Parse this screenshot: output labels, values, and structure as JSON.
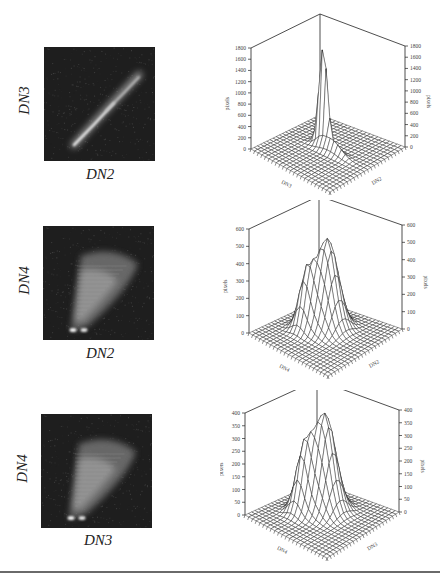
{
  "chart_data": [
    {
      "type": "heatmap",
      "title": "",
      "xlabel": "DN2",
      "ylabel": "DN3",
      "description": "2D scatter-density image: narrow bright diagonal streak from lower-left to upper-right",
      "feature": "diagonal-streak"
    },
    {
      "type": "surface3d",
      "title": "",
      "xlabel": "DN3",
      "ylabel": "DN2",
      "zlabel": "pixels",
      "zticks": [
        0,
        200,
        400,
        600,
        800,
        1000,
        1200,
        1400,
        1600,
        1800
      ],
      "zlim": [
        0,
        1800
      ],
      "peak": 1750,
      "description": "Single very sharp narrow peak near the center-left of the grid"
    },
    {
      "type": "heatmap",
      "title": "",
      "xlabel": "DN2",
      "ylabel": "DN4",
      "description": "2D scatter-density image: broad fan-shaped bright region with two small bright spots at the bottom-left",
      "feature": "fan"
    },
    {
      "type": "surface3d",
      "title": "",
      "xlabel": "DN4",
      "ylabel": "DN2",
      "zlabel": "pixels",
      "zticks": [
        0,
        100,
        200,
        300,
        400,
        500,
        600
      ],
      "zlim": [
        0,
        600
      ],
      "peak": 520,
      "secondary_peak": 110,
      "description": "Broad main ridge peaking ~520 with a small secondary peak ~110"
    },
    {
      "type": "heatmap",
      "title": "",
      "xlabel": "DN3",
      "ylabel": "DN4",
      "description": "2D scatter-density image: broad fan-shaped faint region with small bright spots at bottom-left",
      "feature": "fan"
    },
    {
      "type": "surface3d",
      "title": "",
      "xlabel": "DN4",
      "ylabel": "DN3",
      "zlabel": "pixels",
      "zticks": [
        0,
        50,
        100,
        150,
        200,
        250,
        300,
        350,
        400
      ],
      "zlim": [
        0,
        400
      ],
      "peak": 380,
      "secondary_peak": 100,
      "description": "Broad main ridge peaking ~380 with a small secondary peak ~100"
    }
  ],
  "rows": [
    {
      "image": {
        "xlabel": "DN2",
        "ylabel": "DN3"
      },
      "surface": {
        "left_axis_label": "pixels",
        "right_axis_label": "pixels",
        "base_left_label": "DN3",
        "base_right_label": "DN2",
        "ticks": [
          "0",
          "200",
          "400",
          "600",
          "800",
          "1000",
          "1200",
          "1400",
          "1600",
          "1800"
        ]
      }
    },
    {
      "image": {
        "xlabel": "DN2",
        "ylabel": "DN4"
      },
      "surface": {
        "left_axis_label": "pixels",
        "right_axis_label": "pixels",
        "base_left_label": "DN4",
        "base_right_label": "DN2",
        "ticks": [
          "0",
          "100",
          "200",
          "300",
          "400",
          "500",
          "600"
        ]
      }
    },
    {
      "image": {
        "xlabel": "DN3",
        "ylabel": "DN4"
      },
      "surface": {
        "left_axis_label": "pixels",
        "right_axis_label": "pixels",
        "base_left_label": "DN4",
        "base_right_label": "DN3",
        "ticks": [
          "0",
          "50",
          "100",
          "150",
          "200",
          "250",
          "300",
          "350",
          "400"
        ]
      }
    }
  ],
  "colors": {
    "image_bg": "#1e1e1e",
    "wire": "#222222",
    "rule": "#6a6a6a"
  }
}
